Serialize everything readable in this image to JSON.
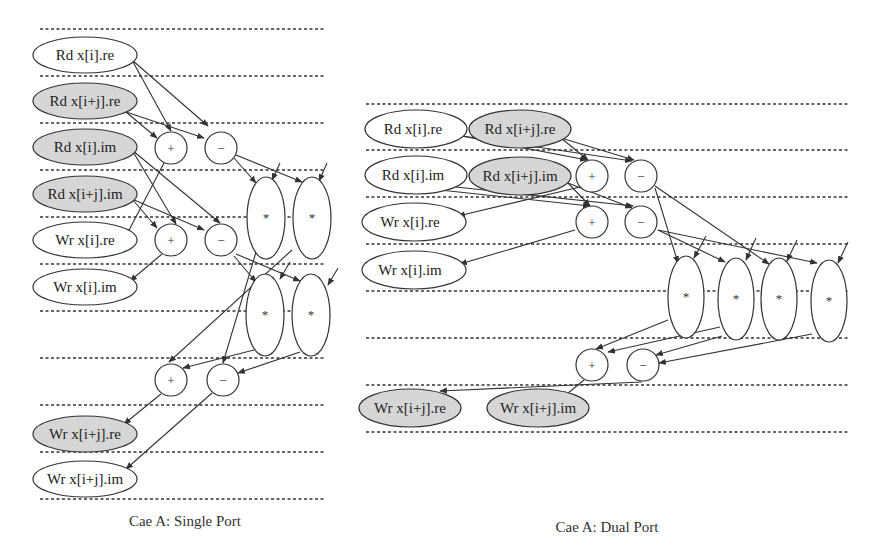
{
  "colors": {
    "shaded_fill": "#d6d6d6",
    "unshaded_fill": "#ffffff",
    "stroke": "#333333"
  },
  "diagrams": [
    {
      "caption": "Cae A: Single Port",
      "memory_nodes": [
        {
          "label": "Rd x[i].re",
          "shaded": false
        },
        {
          "label": "Rd x[i+j].re",
          "shaded": true
        },
        {
          "label": "Rd x[i].im",
          "shaded": true
        },
        {
          "label": "Rd x[i+j].im",
          "shaded": true
        },
        {
          "label": "Wr x[i].re",
          "shaded": false
        },
        {
          "label": "Wr x[i].im",
          "shaded": false
        },
        {
          "label": "Wr x[i+j].re",
          "shaded": true
        },
        {
          "label": "Wr x[i+j].im",
          "shaded": false
        }
      ],
      "ops": [
        "+",
        "−",
        "+",
        "−",
        "*",
        "*",
        "*",
        "*",
        "+",
        "−"
      ]
    },
    {
      "caption": "Cae A: Dual Port",
      "memory_nodes": [
        {
          "label": "Rd x[i].re",
          "shaded": false
        },
        {
          "label": "Rd x[i+j].re",
          "shaded": true
        },
        {
          "label": "Rd x[i].im",
          "shaded": false
        },
        {
          "label": "Rd x[i+j].im",
          "shaded": true
        },
        {
          "label": "Wr x[i].re",
          "shaded": false
        },
        {
          "label": "Wr x[i].im",
          "shaded": false
        },
        {
          "label": "Wr x[i+j].re",
          "shaded": true
        },
        {
          "label": "Wr x[i+j].im",
          "shaded": true
        }
      ],
      "ops": [
        "+",
        "−",
        "+",
        "−",
        "*",
        "*",
        "*",
        "*",
        "+",
        "−"
      ]
    }
  ]
}
